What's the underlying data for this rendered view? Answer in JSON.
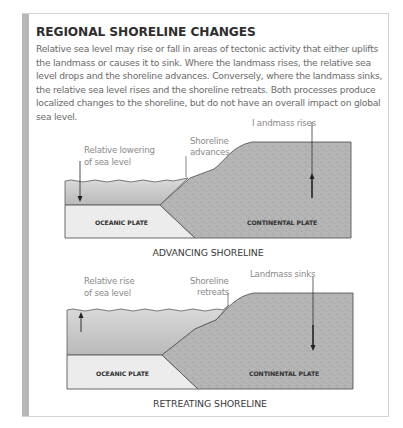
{
  "panel": {
    "title": "REGIONAL SHORELINE CHANGES",
    "body": "Relative sea level may rise or fall in areas of tectonic activity that either uplifts the landmass or causes it to sink. Where the landmass rises, the relative sea level drops and the shoreline advances. Conversely, where the landmass sinks, the relative sea level rises and the shoreline retreats. Both processes produce localized changes to the shoreline, but do not have an overall impact on global sea level."
  },
  "diagrams": [
    {
      "caption": "ADVANCING SHORELINE",
      "sea_label_line1": "Relative lowering",
      "sea_label_line2": "of sea level",
      "shore_label_line1": "Shoreline",
      "shore_label_line2": "advances",
      "land_label": "I andmass rises",
      "oceanic_plate": "OCEANIC PLATE",
      "continental_plate": "CONTINENTAL PLATE",
      "sea_arrow": "down",
      "land_arrow": "up"
    },
    {
      "caption": "RETREATING SHORELINE",
      "sea_label_line1": "Relative rise",
      "sea_label_line2": "of sea level",
      "shore_label_line1": "Shoreline",
      "shore_label_line2": "retreats",
      "land_label": "Landmass sinks",
      "oceanic_plate": "OCEANIC PLATE",
      "continental_plate": "CONTINENTAL PLATE",
      "sea_arrow": "up",
      "land_arrow": "down"
    }
  ],
  "colors": {
    "water_top": "#d9d9d9",
    "water_bottom": "#b8b8b8",
    "oceanic_plate": "#ececec",
    "continental_plate": "#b3b3b3",
    "outline": "#5a5a5a",
    "panel_bar": "#b7b7b7"
  }
}
